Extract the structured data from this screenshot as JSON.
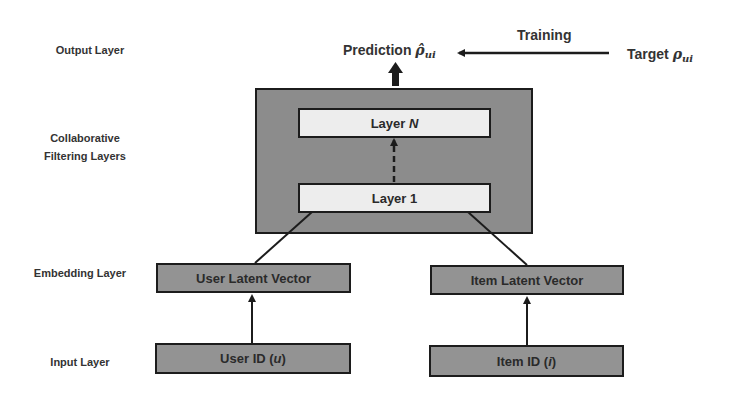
{
  "side_labels": {
    "output": "Output Layer",
    "cf_line1": "Collaborative",
    "cf_line2": "Filtering Layers",
    "embedding": "Embedding Layer",
    "input": "Input Layer"
  },
  "top": {
    "prediction_label": "Prediction",
    "prediction_symbol": "ρ̂",
    "prediction_subscript": "ui",
    "training_label": "Training",
    "target_label": "Target",
    "target_symbol": "ρ",
    "target_subscript": "ui"
  },
  "cf_layers": {
    "layer_n_prefix": "Layer",
    "layer_n_var": "N",
    "layer_1": "Layer 1"
  },
  "embedding": {
    "user": "User Latent Vector",
    "item": "Item Latent Vector"
  },
  "input": {
    "user_prefix": "User ID (",
    "user_var": "u",
    "user_suffix": ")",
    "item_prefix": "Item ID (",
    "item_var": "i",
    "item_suffix": ")"
  },
  "colors": {
    "container_fill": "#8c8c8c",
    "light_box_fill": "#ededed",
    "dark_box_fill": "#939393",
    "stroke": "#1c1c1c"
  }
}
